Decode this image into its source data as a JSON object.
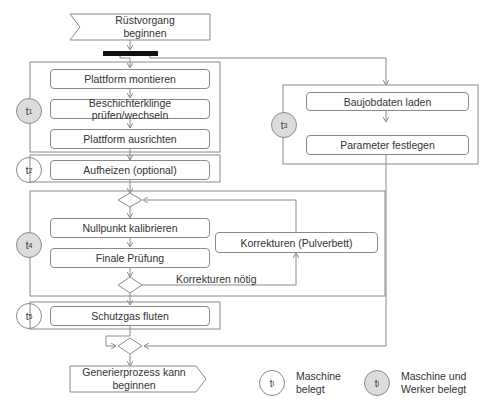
{
  "start": {
    "line1": "Rüstvorgang",
    "line2": "beginnen"
  },
  "end": {
    "line1": "Generierprozess kann",
    "line2": "beginnen"
  },
  "groups": [
    {
      "id": "t1",
      "symbol": "t",
      "sub": "1",
      "type": "Maschine und Werker belegt",
      "steps": [
        "Plattform montieren",
        "Beschichterklinge prüfen/wechseln",
        "Plattform ausrichten"
      ]
    },
    {
      "id": "t2",
      "symbol": "t",
      "sub": "2",
      "type": "Maschine belegt",
      "steps": [
        "Aufheizen (optional)"
      ]
    },
    {
      "id": "t3",
      "symbol": "t",
      "sub": "3",
      "type": "Maschine und Werker belegt",
      "steps": [
        "Baujobdaten laden",
        "Parameter festlegen"
      ]
    },
    {
      "id": "t4",
      "symbol": "t",
      "sub": "4",
      "type": "Maschine und Werker belegt",
      "steps": [
        "Nullpunkt kalibrieren",
        "Finale Prüfung"
      ],
      "loop_step": "Korrekturen (Pulverbett)",
      "loop_label": "Korrekturen nötig"
    },
    {
      "id": "t5",
      "symbol": "t",
      "sub": "5",
      "type": "Maschine belegt",
      "steps": [
        "Schutzgas fluten"
      ]
    }
  ],
  "legend": {
    "symbol": "t",
    "sub": "i",
    "machine": {
      "line1": "Maschine",
      "line2": "belegt"
    },
    "machine_worker": {
      "line1": "Maschine und",
      "line2": "Werker belegt"
    }
  },
  "colors": {
    "line": "#8a8a8a",
    "fill_worker": "#dcdcdc",
    "bar": "#111111"
  }
}
